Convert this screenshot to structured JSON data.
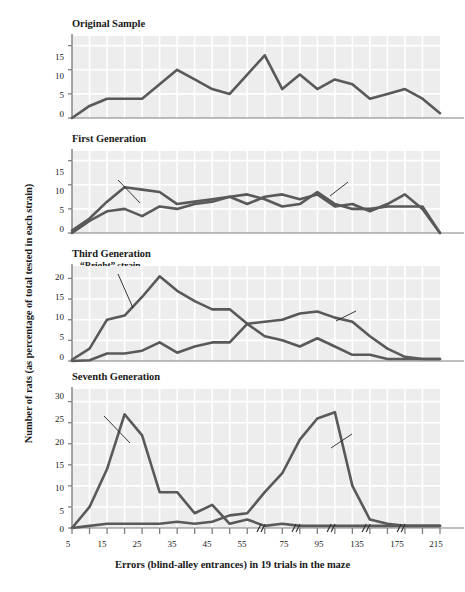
{
  "figure": {
    "ylabel": "Number of rats (as percentage of total tested in each strain)",
    "xlabel": "Errors (blind-alley entrances) in 19 trials in the maze",
    "line_color": "#595959",
    "grid_color": "#ffffff",
    "plot_bg": "#ededed",
    "axis_color": "#808080"
  },
  "xaxis": {
    "tick_labels": [
      "5",
      "15",
      "25",
      "35",
      "45",
      "55",
      "75",
      "95",
      "135",
      "175",
      "215"
    ],
    "break_marks": 5,
    "break_symbol": "//"
  },
  "panels": [
    {
      "title": "Original Sample",
      "yticks": [
        "0",
        "5",
        "10",
        "15"
      ],
      "ymax": 17,
      "annotations": []
    },
    {
      "title": "First Generation",
      "yticks": [
        "0",
        "5",
        "10",
        "15"
      ],
      "ymax": 17,
      "annotations": [
        {
          "text": "“Bright” strain",
          "name": "bright-strain-label"
        },
        {
          "text": "“Dull” strain",
          "name": "dull-strain-label"
        }
      ]
    },
    {
      "title": "Third Generation",
      "yticks": [
        "0",
        "5",
        "10",
        "15",
        "20"
      ],
      "ymax": 23,
      "annotations": [
        {
          "text": "“Bright” strain",
          "name": "bright-strain-label"
        },
        {
          "text": "“Dull” strain",
          "name": "dull-strain-label"
        }
      ]
    },
    {
      "title": "Seventh Generation",
      "yticks": [
        "0",
        "5",
        "10",
        "15",
        "20",
        "25",
        "30"
      ],
      "ymax": 33,
      "annotations": [
        {
          "text": "“Bright” strain",
          "name": "bright-strain-label"
        },
        {
          "text": "“Dull” strain",
          "name": "dull-strain-label"
        }
      ]
    }
  ],
  "chart_data": {
    "type": "line",
    "xlabel": "Errors (blind-alley entrances) in 19 trials in the maze",
    "ylabel": "Number of rats (as percentage of total tested in each strain)",
    "x": [
      5,
      10,
      15,
      20,
      25,
      30,
      35,
      40,
      45,
      50,
      55,
      65,
      75,
      85,
      95,
      115,
      135,
      155,
      175,
      195,
      215
    ],
    "xtick_labels": [
      "5",
      "15",
      "25",
      "35",
      "45",
      "55",
      "75",
      "95",
      "135",
      "175",
      "215"
    ],
    "grid": true,
    "legend": "inline annotations",
    "panels": [
      {
        "name": "Original Sample",
        "ylim": [
          0,
          17
        ],
        "yticks": [
          0,
          5,
          10,
          15
        ],
        "series": [
          {
            "name": "Original sample",
            "values": [
              0,
              2.5,
              4,
              4,
              4,
              7,
              10,
              8,
              6,
              5,
              9,
              13,
              6,
              9,
              6,
              8,
              7,
              4,
              5,
              6,
              4,
              1
            ]
          }
        ]
      },
      {
        "name": "First Generation",
        "ylim": [
          0,
          17
        ],
        "yticks": [
          0,
          5,
          10,
          15
        ],
        "series": [
          {
            "name": "“Bright” strain",
            "values": [
              0.5,
              3,
              6.5,
              9.5,
              9,
              8.5,
              6,
              6.5,
              7,
              7.5,
              6,
              7.5,
              8,
              7,
              8,
              5.5,
              6,
              4.5,
              6,
              8,
              5,
              0
            ]
          },
          {
            "name": "“Dull” strain",
            "values": [
              0,
              2.5,
              4.5,
              5,
              3.5,
              5.5,
              5,
              6,
              6.5,
              7.5,
              8,
              7,
              5.5,
              6,
              8.5,
              6,
              5,
              5,
              5.5,
              5.5,
              5.5,
              0
            ]
          }
        ]
      },
      {
        "name": "Third Generation",
        "ylim": [
          0,
          23
        ],
        "yticks": [
          0,
          5,
          10,
          15,
          20
        ],
        "series": [
          {
            "name": "“Bright” strain",
            "values": [
              0.3,
              3,
              10,
              11,
              15.5,
              20.5,
              17,
              14.5,
              12.5,
              12.5,
              9,
              6,
              5,
              3.5,
              5.5,
              3.5,
              1.5,
              1.5,
              0.5,
              0.5,
              0.5,
              0.5
            ]
          },
          {
            "name": "“Dull” strain",
            "values": [
              0,
              0.2,
              1.8,
              1.8,
              2.5,
              4.5,
              2,
              3.5,
              4.5,
              4.5,
              9,
              9.5,
              10,
              11.5,
              12,
              10.5,
              9.5,
              6,
              3,
              1,
              0.5,
              0.5
            ]
          }
        ]
      },
      {
        "name": "Seventh Generation",
        "ylim": [
          0,
          33
        ],
        "yticks": [
          0,
          5,
          10,
          15,
          20,
          25,
          30
        ],
        "series": [
          {
            "name": "“Bright” strain",
            "values": [
              0,
              5,
              14,
              27,
              22,
              8.5,
              8.5,
              3.5,
              5.5,
              1,
              2,
              0.5,
              1,
              0.5,
              0.5,
              0.5,
              0.5,
              0.5,
              0.5,
              0.5,
              0.5,
              0.5
            ]
          },
          {
            "name": "“Dull” strain",
            "values": [
              0,
              0.5,
              1,
              1,
              1,
              1,
              1.5,
              1,
              1.5,
              3,
              3.5,
              8.5,
              13,
              21,
              26,
              27.5,
              10,
              2,
              1,
              0.5,
              0.5,
              0.5
            ]
          }
        ]
      }
    ]
  }
}
